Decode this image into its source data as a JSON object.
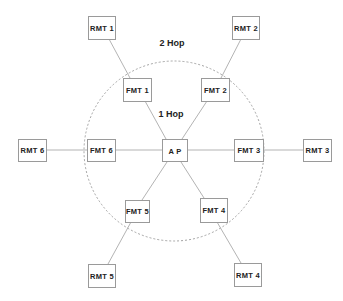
{
  "diagram": {
    "type": "network-topology",
    "labels": {
      "two_hop": "2 Hop",
      "one_hop": "1 Hop"
    },
    "colors": {
      "box_stroke": "#9a9a9a",
      "link": "#aaaaaa",
      "ring": "#9a9a9a",
      "text": "#222222"
    },
    "hub": {
      "id": "ap",
      "label": "A P"
    },
    "first_hop": [
      {
        "id": "fmt1",
        "label": "FMT  1"
      },
      {
        "id": "fmt2",
        "label": "FMT  2"
      },
      {
        "id": "fmt3",
        "label": "FMT  3"
      },
      {
        "id": "fmt4",
        "label": "FMT  4"
      },
      {
        "id": "fmt5",
        "label": "FMT  5"
      },
      {
        "id": "fmt6",
        "label": "FMT  6"
      }
    ],
    "second_hop": [
      {
        "id": "rmt1",
        "label": "RMT  1"
      },
      {
        "id": "rmt2",
        "label": "RMT  2"
      },
      {
        "id": "rmt3",
        "label": "RMT  3"
      },
      {
        "id": "rmt4",
        "label": "RMT  4"
      },
      {
        "id": "rmt5",
        "label": "RMT  5"
      },
      {
        "id": "rmt6",
        "label": "RMT  6"
      }
    ],
    "edges": [
      [
        "ap",
        "fmt1"
      ],
      [
        "ap",
        "fmt2"
      ],
      [
        "ap",
        "fmt3"
      ],
      [
        "ap",
        "fmt4"
      ],
      [
        "ap",
        "fmt5"
      ],
      [
        "ap",
        "fmt6"
      ],
      [
        "fmt1",
        "rmt1"
      ],
      [
        "fmt2",
        "rmt2"
      ],
      [
        "fmt3",
        "rmt3"
      ],
      [
        "fmt4",
        "rmt4"
      ],
      [
        "fmt5",
        "rmt5"
      ],
      [
        "fmt6",
        "rmt6"
      ]
    ]
  }
}
